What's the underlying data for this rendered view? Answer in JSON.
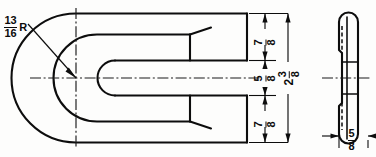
{
  "drawing": {
    "title": "U-bend hairpin bracket detail drawing",
    "units": "inch (fractional)",
    "background_color": "#fdfdfc",
    "line_color": "#0d0d0d",
    "views": [
      {
        "name": "front-view",
        "description": "U-shaped hairpin form, two parallel arms joined by a semicircular bend at the left, arm ends chamfered at the right"
      },
      {
        "name": "side-view",
        "description": "Right end view, narrow bar with rounded top and bottom ends and hidden interior lines"
      }
    ],
    "dimensions": {
      "radius": {
        "whole": "",
        "numerator": "13",
        "denominator": "16",
        "suffix": "R",
        "label": "13/16 R",
        "name": "bend-radius"
      },
      "upper_arm": {
        "whole": "",
        "numerator": "7",
        "denominator": "8",
        "suffix": "",
        "label": "7/8",
        "name": "upper-arm-width"
      },
      "gap": {
        "whole": "",
        "numerator": "5",
        "denominator": "8",
        "suffix": "",
        "label": "5/8",
        "name": "slot-gap"
      },
      "lower_arm": {
        "whole": "",
        "numerator": "7",
        "denominator": "8",
        "suffix": "",
        "label": "7/8",
        "name": "lower-arm-width"
      },
      "overall_height": {
        "whole": "2",
        "numerator": "3",
        "denominator": "8",
        "suffix": "",
        "label": "2 3/8",
        "name": "overall-height"
      },
      "thickness": {
        "whole": "",
        "numerator": "5",
        "denominator": "8",
        "suffix": "",
        "label": "5/8",
        "name": "material-thickness"
      }
    }
  }
}
